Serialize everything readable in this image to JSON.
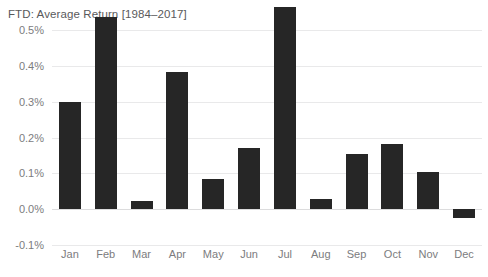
{
  "chart_data": {
    "type": "bar",
    "title": "FTD: Average Return [1984–2017]",
    "xlabel": "",
    "ylabel": "",
    "categories": [
      "Jan",
      "Feb",
      "Mar",
      "Apr",
      "May",
      "Jun",
      "Jul",
      "Aug",
      "Sep",
      "Oct",
      "Nov",
      "Dec"
    ],
    "values": [
      0.3,
      0.535,
      0.022,
      0.383,
      0.085,
      0.17,
      0.565,
      0.027,
      0.155,
      0.183,
      0.105,
      -0.025
    ],
    "value_unit": "percent",
    "ylim": [
      -0.1,
      0.5
    ],
    "ytick_values": [
      0.5,
      0.4,
      0.3,
      0.2,
      0.1,
      0.0,
      -0.1
    ],
    "ytick_labels": [
      "0.5%",
      "0.4%",
      "0.3%",
      "0.2%",
      "0.1%",
      "0.0%",
      "-0.1%"
    ],
    "grid": true,
    "legend": false,
    "series": [
      {
        "name": "Average Return",
        "values": [
          0.3,
          0.535,
          0.022,
          0.383,
          0.085,
          0.17,
          0.565,
          0.027,
          0.155,
          0.183,
          0.105,
          -0.025
        ]
      }
    ],
    "colors": {
      "bar": "#262626",
      "gridline": "#e9e9ea",
      "zero_line": "#dcdcdd",
      "text": "#7c7c7e",
      "title_text": "#59595b",
      "background": "#ffffff"
    }
  }
}
